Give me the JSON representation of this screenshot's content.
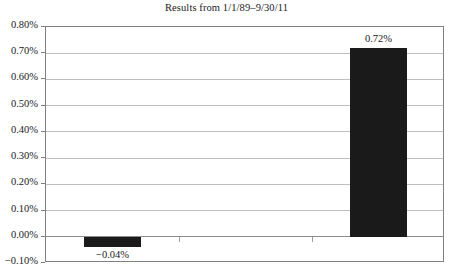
{
  "chart_data": {
    "type": "bar",
    "title": "Results from 1/1/89–9/30/11",
    "xlabel": "",
    "ylabel": "",
    "categories": [
      "",
      "",
      ""
    ],
    "values": [
      -0.04,
      null,
      0.72
    ],
    "data_labels": [
      "−0.04%",
      "",
      "0.72%"
    ],
    "ylim": [
      -0.1,
      0.8
    ],
    "ytick_values": [
      0.8,
      0.7,
      0.6,
      0.5,
      0.4,
      0.3,
      0.2,
      0.1,
      0.0,
      -0.1
    ],
    "ytick_labels": [
      "0.80%",
      "0.70%",
      "0.60%",
      "0.50%",
      "0.40%",
      "0.30%",
      "0.20%",
      "0.10%",
      "0.00%",
      "−0.10%"
    ],
    "value_unit": "percent",
    "grid": true,
    "legend": false,
    "legend_position": "none",
    "series": [
      {
        "name": "Results",
        "values": [
          -0.04,
          null,
          0.72
        ]
      }
    ],
    "colors": {
      "bar_fill": "#1a1a1a",
      "gridline": "#bfbfbf",
      "zero_line": "#8c8c8c",
      "axis_border": "#808080",
      "text": "#1a1a1a",
      "background": "#ffffff"
    }
  }
}
